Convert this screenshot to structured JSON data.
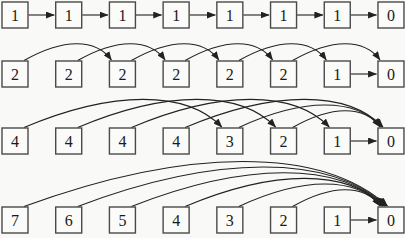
{
  "canvas": {
    "width": 405,
    "height": 238,
    "background": "#f9f9f7"
  },
  "diagram": {
    "box": {
      "width": 26,
      "height": 26,
      "fill": "#fbfbf9",
      "border_color": "#4a4a4a",
      "text_color": "#1a1a1a"
    },
    "arrow_color": "#222222",
    "grid": {
      "x_start": 2,
      "x_pitch": 53.71
    },
    "rows": [
      {
        "box_top": 2,
        "values": [
          "1",
          "1",
          "1",
          "1",
          "1",
          "1",
          "1",
          "0"
        ],
        "links": [
          {
            "from": 0,
            "to": 1,
            "style": "straight"
          },
          {
            "from": 1,
            "to": 2,
            "style": "straight"
          },
          {
            "from": 2,
            "to": 3,
            "style": "straight"
          },
          {
            "from": 3,
            "to": 4,
            "style": "straight"
          },
          {
            "from": 4,
            "to": 5,
            "style": "straight"
          },
          {
            "from": 5,
            "to": 6,
            "style": "straight"
          },
          {
            "from": 6,
            "to": 7,
            "style": "straight"
          }
        ]
      },
      {
        "box_top": 61,
        "values": [
          "2",
          "2",
          "2",
          "2",
          "2",
          "2",
          "1",
          "0"
        ],
        "links": [
          {
            "from": 0,
            "to": 2,
            "style": "arc"
          },
          {
            "from": 1,
            "to": 3,
            "style": "arc"
          },
          {
            "from": 2,
            "to": 4,
            "style": "arc"
          },
          {
            "from": 3,
            "to": 5,
            "style": "arc"
          },
          {
            "from": 4,
            "to": 6,
            "style": "arc"
          },
          {
            "from": 5,
            "to": 7,
            "style": "arc"
          },
          {
            "from": 6,
            "to": 7,
            "style": "straight"
          }
        ]
      },
      {
        "box_top": 128,
        "values": [
          "4",
          "4",
          "4",
          "4",
          "3",
          "2",
          "1",
          "0"
        ],
        "links": [
          {
            "from": 0,
            "to": 4,
            "style": "arc"
          },
          {
            "from": 1,
            "to": 5,
            "style": "arc"
          },
          {
            "from": 2,
            "to": 6,
            "style": "arc"
          },
          {
            "from": 3,
            "to": 7,
            "style": "arc"
          },
          {
            "from": 4,
            "to": 7,
            "style": "arc"
          },
          {
            "from": 5,
            "to": 7,
            "style": "arc"
          },
          {
            "from": 6,
            "to": 7,
            "style": "straight"
          }
        ]
      },
      {
        "box_top": 207,
        "values": [
          "7",
          "6",
          "5",
          "4",
          "3",
          "2",
          "1",
          "0"
        ],
        "links": [
          {
            "from": 0,
            "to": 7,
            "style": "arc"
          },
          {
            "from": 1,
            "to": 7,
            "style": "arc"
          },
          {
            "from": 2,
            "to": 7,
            "style": "arc"
          },
          {
            "from": 3,
            "to": 7,
            "style": "arc"
          },
          {
            "from": 4,
            "to": 7,
            "style": "arc"
          },
          {
            "from": 5,
            "to": 7,
            "style": "arc"
          },
          {
            "from": 6,
            "to": 7,
            "style": "straight"
          }
        ]
      }
    ]
  }
}
